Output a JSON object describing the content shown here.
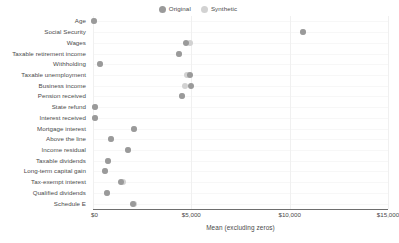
{
  "legend": {
    "position": "top-center",
    "items": [
      {
        "label": "Original",
        "color": "#9a9a9a",
        "icon": "circle-marker-icon"
      },
      {
        "label": "Synthetic",
        "color": "#d2d2d2",
        "icon": "circle-marker-icon"
      }
    ]
  },
  "axis": {
    "x_title": "Mean (excluding zeros)",
    "x_ticks": [
      "$0",
      "$5,000",
      "$10,000",
      "$15,000"
    ],
    "x_tick_values": [
      0,
      5000,
      10000,
      15000
    ]
  },
  "chart_data": {
    "type": "scatter",
    "title": "",
    "subtitle": "",
    "xlabel": "Mean (excluding zeros)",
    "ylabel": "",
    "xlim": [
      0,
      15000
    ],
    "grid": true,
    "legend_position": "top-center",
    "categories": [
      "Age",
      "Social Security",
      "Wages",
      "Taxable retirement income",
      "Withholding",
      "Taxable unemployment",
      "Business income",
      "Pension received",
      "State refund",
      "Interest received",
      "Mortgage interest",
      "Above the line",
      "Income residual",
      "Taxable dividends",
      "Long-term capital gain",
      "Tax-exempt interest",
      "Qualified dividends",
      "Schedule E"
    ],
    "series": [
      {
        "name": "Original",
        "color": "#9a9a9a",
        "values": [
          60,
          10700,
          4750,
          4350,
          380,
          4950,
          5000,
          4550,
          100,
          110,
          2100,
          900,
          1800,
          750,
          620,
          1400,
          700,
          2050
        ]
      },
      {
        "name": "Synthetic",
        "color": "#d2d2d2",
        "values": [
          60,
          10700,
          4920,
          4350,
          380,
          4800,
          4700,
          4550,
          100,
          110,
          2100,
          900,
          1800,
          750,
          620,
          1500,
          700,
          2100
        ]
      }
    ]
  }
}
